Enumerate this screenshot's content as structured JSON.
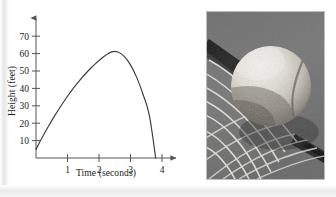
{
  "figure": {
    "kind": "textbook-figure",
    "panels": [
      "height-vs-time-graph",
      "tennis-ball-on-racket-photo"
    ]
  },
  "chart_data": {
    "type": "line",
    "title": "",
    "subtitle": "",
    "xlabel": "Time (seconds)",
    "ylabel": "Height (feet)",
    "xlim": [
      0,
      4.35
    ],
    "ylim": [
      0,
      76
    ],
    "xticks": [
      1,
      2,
      3,
      4
    ],
    "xticklabels": [
      "1",
      "2",
      "3",
      "4"
    ],
    "yticks": [
      10,
      20,
      30,
      40,
      50,
      60,
      70
    ],
    "yticklabels": [
      "10",
      "20",
      "30",
      "40",
      "50",
      "60",
      "70"
    ],
    "grid": false,
    "legend": null,
    "axis_arrows": true,
    "curve_color": "#3b3b3b",
    "axis_color": "#555555",
    "series": [
      {
        "name": "Height of ball",
        "description": "parabolic trajectory, starts near 5 ft, peaks about 61 ft at t = 1.9 s, returns to 0 ft at t = 3.8 s",
        "x": [
          0,
          0.2,
          0.4,
          0.6,
          0.8,
          1.0,
          1.2,
          1.4,
          1.6,
          1.8,
          1.9,
          2.0,
          2.2,
          2.4,
          2.6,
          2.8,
          3.0,
          3.2,
          3.4,
          3.6,
          3.8
        ],
        "y": [
          5,
          11.9,
          18.4,
          24.5,
          30.2,
          35.5,
          40.4,
          44.9,
          49.0,
          52.7,
          54.4,
          56.0,
          58.9,
          61.0,
          60.9,
          58.4,
          53.5,
          46.2,
          36.5,
          24.4,
          0.0
        ]
      }
    ],
    "peak": {
      "x": 1.9,
      "y": 61
    },
    "intercepts": {
      "y_at_x0": 5,
      "x_at_y0": 3.8
    }
  },
  "photo": {
    "caption": "",
    "subject": "tennis ball compressed against racket strings",
    "palette": "black-and-white",
    "border_color": "#bdbdbd"
  }
}
